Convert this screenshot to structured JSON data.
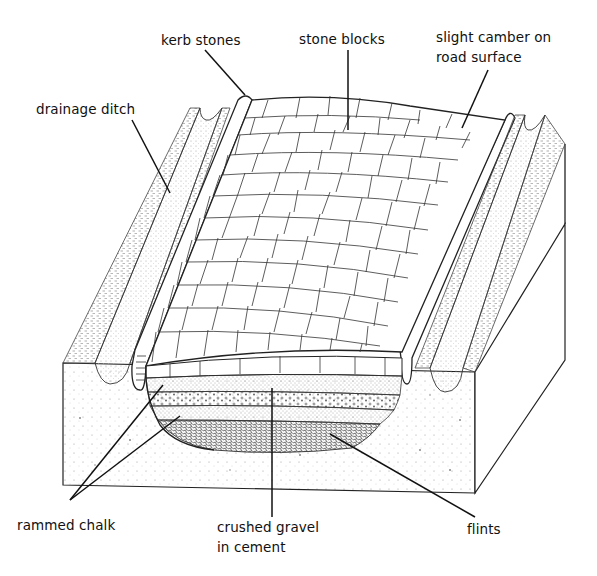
{
  "diagram": {
    "labels": {
      "kerb_stones": "kerb stones",
      "stone_blocks": "stone blocks",
      "camber_line1": "slight camber on",
      "camber_line2": "road surface",
      "drainage_ditch": "drainage ditch",
      "rammed_chalk": "rammed chalk",
      "gravel_line1": "crushed gravel",
      "gravel_line2": "in cement",
      "flints": "flints"
    },
    "layers_top_to_bottom": [
      "stone blocks",
      "rammed chalk",
      "crushed gravel in cement",
      "rammed chalk",
      "flints"
    ],
    "colors": {
      "line": "#111111",
      "background": "#ffffff",
      "stipple": "#555555"
    }
  }
}
